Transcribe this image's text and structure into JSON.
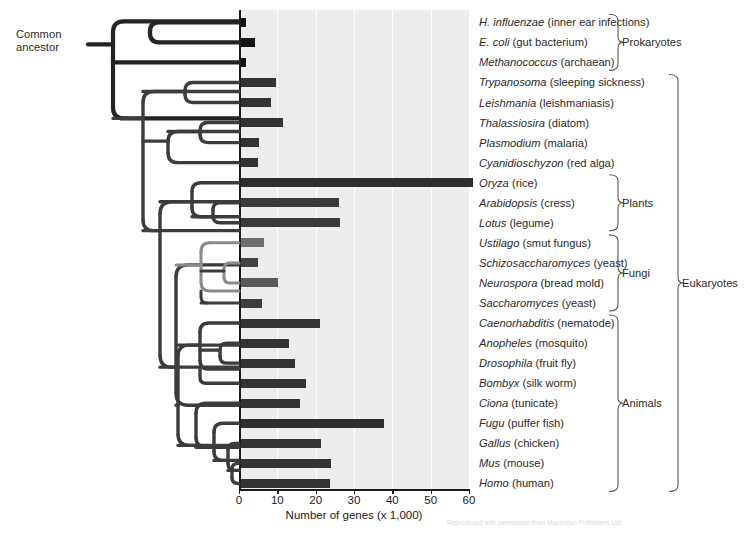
{
  "figure": {
    "ancestor_label_line1": "Common",
    "ancestor_label_line2": "ancestor",
    "credit": "Reproduced with permission from Macmillan Publishers Ltd."
  },
  "chart_data": {
    "type": "bar",
    "title": "",
    "xlabel": "Number of genes (x 1,000)",
    "ylabel": "",
    "xlim": [
      0,
      60
    ],
    "xticks": [
      0,
      10,
      20,
      30,
      40,
      50,
      60
    ],
    "grid": true,
    "orientation": "horizontal",
    "legend": "none",
    "categories": [
      "H. influenzae",
      "E. coli",
      "Methanococcus",
      "Trypanosoma",
      "Leishmania",
      "Thalassiosira",
      "Plasmodium",
      "Cyanidioschyzon",
      "Oryza",
      "Arabidopsis",
      "Lotus",
      "Ustilago",
      "Schizosaccharomyces",
      "Neurospora",
      "Saccharomyces",
      "Caenorhabditis",
      "Anopheles",
      "Drosophila",
      "Bombyx",
      "Ciona",
      "Fugu",
      "Gallus",
      "Mus",
      "Homo"
    ],
    "values": [
      1.8,
      4.3,
      1.8,
      9.6,
      8.3,
      11.4,
      5.3,
      5.0,
      61.0,
      26.2,
      26.4,
      6.5,
      4.9,
      10.1,
      5.9,
      21.0,
      13.0,
      14.6,
      17.6,
      16.0,
      37.8,
      21.4,
      24.0,
      23.8
    ],
    "bar_colors": [
      "#141414",
      "#141414",
      "#141414",
      "#333333",
      "#333333",
      "#333333",
      "#333333",
      "#333333",
      "#2e2e2e",
      "#3a3a3a",
      "#3a3a3a",
      "#6e6e6e",
      "#444444",
      "#5a5a5a",
      "#3d3d3d",
      "#333333",
      "#333333",
      "#333333",
      "#333333",
      "#333333",
      "#2e2e2e",
      "#333333",
      "#333333",
      "#333333"
    ]
  },
  "species": [
    {
      "genus": "H. influenzae",
      "common": "(inner ear infections)"
    },
    {
      "genus": "E. coli",
      "common": "(gut bacterium)"
    },
    {
      "genus": "Methanococcus",
      "common": "(archaean)"
    },
    {
      "genus": "Trypanosoma",
      "common": "(sleeping sickness)"
    },
    {
      "genus": "Leishmania",
      "common": "(leishmaniasis)"
    },
    {
      "genus": "Thalassiosira",
      "common": "(diatom)"
    },
    {
      "genus": "Plasmodium",
      "common": "(malaria)"
    },
    {
      "genus": "Cyanidioschyzon",
      "common": "(red alga)"
    },
    {
      "genus": "Oryza",
      "common": "(rice)"
    },
    {
      "genus": "Arabidopsis",
      "common": "(cress)"
    },
    {
      "genus": "Lotus",
      "common": "(legume)"
    },
    {
      "genus": "Ustilago",
      "common": "(smut fungus)"
    },
    {
      "genus": "Schizosaccharomyces",
      "common": "(yeast)"
    },
    {
      "genus": "Neurospora",
      "common": "(bread mold)"
    },
    {
      "genus": "Saccharomyces",
      "common": "(yeast)"
    },
    {
      "genus": "Caenorhabditis",
      "common": "(nematode)"
    },
    {
      "genus": "Anopheles",
      "common": "(mosquito)"
    },
    {
      "genus": "Drosophila",
      "common": "(fruit fly)"
    },
    {
      "genus": "Bombyx",
      "common": "(silk worm)"
    },
    {
      "genus": "Ciona",
      "common": "(tunicate)"
    },
    {
      "genus": "Fugu",
      "common": "(puffer fish)"
    },
    {
      "genus": "Gallus",
      "common": "(chicken)"
    },
    {
      "genus": "Mus",
      "common": "(mouse)"
    },
    {
      "genus": "Homo",
      "common": "(human)"
    }
  ],
  "groups": [
    {
      "label": "Prokaryotes",
      "first": 0,
      "last": 2
    },
    {
      "label": "Plants",
      "first": 8,
      "last": 10
    },
    {
      "label": "Fungi",
      "first": 11,
      "last": 14
    },
    {
      "label": "Animals",
      "first": 15,
      "last": 23
    },
    {
      "label": "Eukaryotes",
      "first": 3,
      "last": 23
    }
  ],
  "colors": {
    "plot_background": "#ededed",
    "gridline": "#ffffff",
    "axis": "#1a1a1a",
    "tree_dark": "#242424",
    "tree_mid": "#3c3c3c",
    "tree_light": "#8a8a8a",
    "text": "#2a2a2a"
  }
}
